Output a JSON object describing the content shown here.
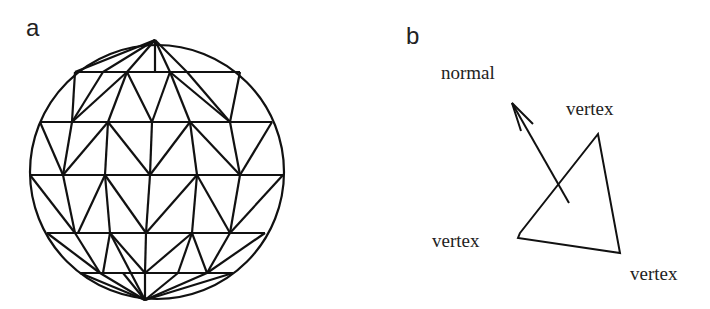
{
  "panel_a": {
    "label": "a",
    "description": "sphere approximated by triangular mesh"
  },
  "panel_b": {
    "label": "b",
    "normal_label": "normal",
    "vertex_labels": [
      "vertex",
      "vertex",
      "vertex"
    ]
  }
}
